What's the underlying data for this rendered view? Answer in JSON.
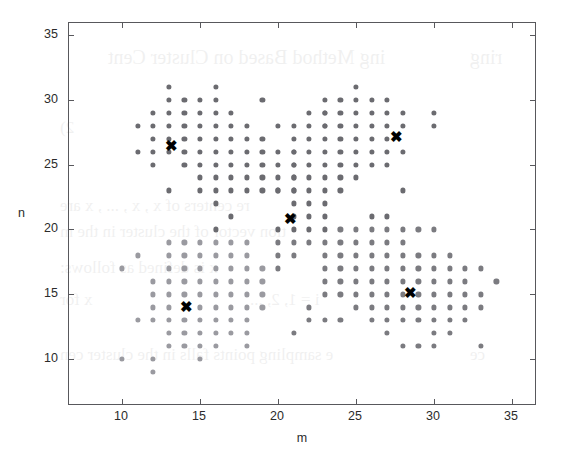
{
  "figure": {
    "axes": {
      "xlabel": "m",
      "ylabel": "n",
      "xticks": [
        10,
        15,
        20,
        25,
        30,
        35
      ],
      "yticks": [
        10,
        15,
        20,
        25,
        30,
        35
      ],
      "xlim": [
        6.6,
        36.6
      ],
      "ylim": [
        6.4,
        35.9
      ],
      "box": true,
      "grid": false,
      "axis_color": "#58585c"
    },
    "bleed_text": [
      {
        "text": "ing Method Based on Cluster Cent",
        "x": 108,
        "y": 46,
        "size": 20
      },
      {
        "text": "ring",
        "x": 470,
        "y": 46,
        "size": 20
      },
      {
        "text": "2)",
        "x": 60,
        "y": 118,
        "size": 17
      },
      {
        "text": "re centers of x  , x  , ... , x     are",
        "x": 60,
        "y": 196,
        "size": 17
      },
      {
        "text": "tion vector of the cluster in the m",
        "x": 60,
        "y": 222,
        "size": 17
      },
      {
        "text": "x    is defined as follows:",
        "x": 60,
        "y": 258,
        "size": 17
      },
      {
        "text": "x   for",
        "x": 60,
        "y": 290,
        "size": 17
      },
      {
        "text": "i = 1, 2, ...",
        "x": 250,
        "y": 290,
        "size": 17
      },
      {
        "text": "e sampling points falls in the cluster cen",
        "x": 60,
        "y": 345,
        "size": 17
      },
      {
        "text": "ce",
        "x": 470,
        "y": 345,
        "size": 17
      }
    ]
  },
  "chart_data": {
    "type": "scatter",
    "title": "",
    "xlabel": "m",
    "ylabel": "n",
    "xlim": [
      6.6,
      36.6
    ],
    "ylim": [
      6.4,
      35.9
    ],
    "grid": false,
    "legend": null,
    "series": [
      {
        "name": "cluster-1-points",
        "marker": "circle",
        "color": "#6b6b70",
        "size": 5.2,
        "points": [
          [
            13,
            31
          ],
          [
            16,
            31
          ],
          [
            13,
            30
          ],
          [
            14,
            30
          ],
          [
            15,
            30
          ],
          [
            16,
            30
          ],
          [
            19,
            30
          ],
          [
            12,
            29
          ],
          [
            13,
            29
          ],
          [
            14,
            29
          ],
          [
            15,
            29
          ],
          [
            16,
            29
          ],
          [
            17,
            29
          ],
          [
            23,
            29
          ],
          [
            11,
            28
          ],
          [
            12,
            28
          ],
          [
            13,
            28
          ],
          [
            14,
            28
          ],
          [
            15,
            28
          ],
          [
            16,
            28
          ],
          [
            17,
            28
          ],
          [
            18,
            28
          ],
          [
            20,
            28
          ],
          [
            23,
            28
          ],
          [
            12,
            27
          ],
          [
            13,
            27
          ],
          [
            14,
            27
          ],
          [
            15,
            27
          ],
          [
            16,
            27
          ],
          [
            17,
            27
          ],
          [
            18,
            27
          ],
          [
            11,
            26
          ],
          [
            12,
            26
          ],
          [
            13,
            26
          ],
          [
            14,
            26
          ],
          [
            15,
            26
          ],
          [
            16,
            26
          ],
          [
            17,
            26
          ],
          [
            18,
            26
          ],
          [
            19,
            26
          ],
          [
            21,
            26
          ],
          [
            12,
            25
          ],
          [
            14,
            25
          ],
          [
            15,
            25
          ],
          [
            16,
            25
          ],
          [
            17,
            25
          ],
          [
            18,
            25
          ],
          [
            19,
            25
          ],
          [
            21,
            25
          ],
          [
            15,
            24
          ],
          [
            16,
            24
          ],
          [
            17,
            24
          ],
          [
            18,
            24
          ],
          [
            19,
            24
          ],
          [
            21,
            24
          ],
          [
            13,
            23
          ],
          [
            15,
            23
          ],
          [
            16,
            23
          ],
          [
            17,
            23
          ],
          [
            18,
            23
          ],
          [
            19,
            23
          ],
          [
            20,
            23
          ],
          [
            21,
            23
          ],
          [
            16,
            22
          ],
          [
            21,
            22
          ],
          [
            22,
            22
          ],
          [
            17,
            21
          ],
          [
            21,
            21
          ],
          [
            22,
            21
          ],
          [
            23,
            21
          ],
          [
            16,
            20
          ],
          [
            20,
            20
          ],
          [
            21,
            20
          ],
          [
            22,
            20
          ],
          [
            23,
            20
          ]
        ]
      },
      {
        "name": "cluster-2-points",
        "marker": "circle",
        "color": "#6b6b70",
        "size": 5.2,
        "points": [
          [
            25,
            31
          ],
          [
            23,
            30
          ],
          [
            24,
            30
          ],
          [
            25,
            30
          ],
          [
            26,
            30
          ],
          [
            27,
            30
          ],
          [
            22,
            29
          ],
          [
            23,
            29
          ],
          [
            24,
            29
          ],
          [
            25,
            29
          ],
          [
            26,
            29
          ],
          [
            27,
            29
          ],
          [
            28,
            29
          ],
          [
            30,
            29
          ],
          [
            21,
            28
          ],
          [
            22,
            28
          ],
          [
            23,
            28
          ],
          [
            24,
            28
          ],
          [
            25,
            28
          ],
          [
            26,
            28
          ],
          [
            27,
            28
          ],
          [
            28,
            28
          ],
          [
            30,
            28
          ],
          [
            19,
            27
          ],
          [
            21,
            27
          ],
          [
            22,
            27
          ],
          [
            23,
            27
          ],
          [
            24,
            27
          ],
          [
            25,
            27
          ],
          [
            26,
            27
          ],
          [
            27,
            27
          ],
          [
            20,
            26
          ],
          [
            21,
            26
          ],
          [
            22,
            26
          ],
          [
            23,
            26
          ],
          [
            24,
            26
          ],
          [
            25,
            26
          ],
          [
            26,
            26
          ],
          [
            27,
            26
          ],
          [
            28,
            26
          ],
          [
            20,
            25
          ],
          [
            21,
            25
          ],
          [
            22,
            25
          ],
          [
            23,
            25
          ],
          [
            24,
            25
          ],
          [
            25,
            25
          ],
          [
            26,
            25
          ],
          [
            27,
            25
          ],
          [
            20,
            24
          ],
          [
            21,
            24
          ],
          [
            22,
            24
          ],
          [
            23,
            24
          ],
          [
            24,
            24
          ],
          [
            25,
            24
          ],
          [
            20,
            23
          ],
          [
            21,
            23
          ],
          [
            22,
            23
          ],
          [
            23,
            23
          ],
          [
            24,
            23
          ],
          [
            28,
            23
          ],
          [
            23,
            22
          ],
          [
            26,
            21
          ],
          [
            27,
            21
          ]
        ]
      },
      {
        "name": "cluster-3-points",
        "marker": "circle",
        "color": "#9a9aa0",
        "size": 5.2,
        "points": [
          [
            13,
            19
          ],
          [
            14,
            19
          ],
          [
            15,
            19
          ],
          [
            16,
            19
          ],
          [
            17,
            19
          ],
          [
            18,
            19
          ],
          [
            11,
            18
          ],
          [
            13,
            18
          ],
          [
            14,
            18
          ],
          [
            15,
            18
          ],
          [
            16,
            18
          ],
          [
            17,
            18
          ],
          [
            18,
            18
          ],
          [
            10,
            17
          ],
          [
            13,
            17
          ],
          [
            14,
            17
          ],
          [
            15,
            17
          ],
          [
            16,
            17
          ],
          [
            17,
            17
          ],
          [
            18,
            17
          ],
          [
            19,
            17
          ],
          [
            12,
            16
          ],
          [
            13,
            16
          ],
          [
            14,
            16
          ],
          [
            15,
            16
          ],
          [
            16,
            16
          ],
          [
            17,
            16
          ],
          [
            18,
            16
          ],
          [
            19,
            16
          ],
          [
            12,
            15
          ],
          [
            13,
            15
          ],
          [
            14,
            15
          ],
          [
            15,
            15
          ],
          [
            16,
            15
          ],
          [
            17,
            15
          ],
          [
            18,
            15
          ],
          [
            19,
            15
          ],
          [
            12,
            14
          ],
          [
            13,
            14
          ],
          [
            15,
            14
          ],
          [
            16,
            14
          ],
          [
            17,
            14
          ],
          [
            18,
            14
          ],
          [
            19,
            14
          ],
          [
            11,
            13
          ],
          [
            12,
            13
          ],
          [
            13,
            13
          ],
          [
            14,
            13
          ],
          [
            15,
            13
          ],
          [
            16,
            13
          ],
          [
            17,
            13
          ],
          [
            18,
            13
          ],
          [
            13,
            12
          ],
          [
            14,
            12
          ],
          [
            15,
            12
          ],
          [
            16,
            12
          ],
          [
            17,
            12
          ],
          [
            18,
            12
          ],
          [
            13,
            11
          ],
          [
            14,
            11
          ],
          [
            15,
            11
          ],
          [
            16,
            11
          ],
          [
            18,
            11
          ],
          [
            10,
            10
          ],
          [
            12,
            10
          ],
          [
            15,
            10
          ],
          [
            12,
            9
          ]
        ]
      },
      {
        "name": "cluster-4-points",
        "marker": "circle",
        "color": "#7b7b80",
        "size": 5.2,
        "points": [
          [
            24,
            20
          ],
          [
            25,
            20
          ],
          [
            26,
            20
          ],
          [
            27,
            20
          ],
          [
            28,
            20
          ],
          [
            29,
            20
          ],
          [
            30,
            20
          ],
          [
            20,
            19
          ],
          [
            21,
            19
          ],
          [
            22,
            19
          ],
          [
            23,
            19
          ],
          [
            24,
            19
          ],
          [
            25,
            19
          ],
          [
            26,
            19
          ],
          [
            27,
            19
          ],
          [
            28,
            19
          ],
          [
            20,
            18
          ],
          [
            21,
            18
          ],
          [
            23,
            18
          ],
          [
            24,
            18
          ],
          [
            25,
            18
          ],
          [
            26,
            18
          ],
          [
            27,
            18
          ],
          [
            28,
            18
          ],
          [
            29,
            18
          ],
          [
            30,
            18
          ],
          [
            31,
            18
          ],
          [
            20,
            17
          ],
          [
            23,
            17
          ],
          [
            24,
            17
          ],
          [
            25,
            17
          ],
          [
            26,
            17
          ],
          [
            27,
            17
          ],
          [
            28,
            17
          ],
          [
            29,
            17
          ],
          [
            30,
            17
          ],
          [
            31,
            17
          ],
          [
            32,
            17
          ],
          [
            33,
            17
          ],
          [
            23,
            16
          ],
          [
            24,
            16
          ],
          [
            25,
            16
          ],
          [
            26,
            16
          ],
          [
            27,
            16
          ],
          [
            28,
            16
          ],
          [
            29,
            16
          ],
          [
            30,
            16
          ],
          [
            31,
            16
          ],
          [
            32,
            16
          ],
          [
            34,
            16
          ],
          [
            23,
            15
          ],
          [
            24,
            15
          ],
          [
            25,
            15
          ],
          [
            26,
            15
          ],
          [
            27,
            15
          ],
          [
            28,
            15
          ],
          [
            29,
            15
          ],
          [
            30,
            15
          ],
          [
            31,
            15
          ],
          [
            32,
            15
          ],
          [
            33,
            15
          ],
          [
            22,
            14
          ],
          [
            25,
            14
          ],
          [
            26,
            14
          ],
          [
            27,
            14
          ],
          [
            28,
            14
          ],
          [
            29,
            14
          ],
          [
            30,
            14
          ],
          [
            31,
            14
          ],
          [
            32,
            14
          ],
          [
            33,
            14
          ],
          [
            22,
            13
          ],
          [
            23,
            13
          ],
          [
            24,
            13
          ],
          [
            26,
            13
          ],
          [
            27,
            13
          ],
          [
            28,
            13
          ],
          [
            29,
            13
          ],
          [
            30,
            13
          ],
          [
            31,
            13
          ],
          [
            32,
            13
          ],
          [
            21,
            12
          ],
          [
            27,
            12
          ],
          [
            30,
            12
          ],
          [
            31,
            12
          ],
          [
            28,
            11
          ],
          [
            29,
            11
          ],
          [
            30,
            11
          ],
          [
            33,
            11
          ]
        ]
      },
      {
        "name": "cluster-centers",
        "marker": "x",
        "color": "#000000",
        "size": 15,
        "points": [
          [
            13.2,
            26.5
          ],
          [
            20.8,
            20.9
          ],
          [
            27.6,
            27.2
          ],
          [
            28.5,
            15.2
          ],
          [
            14.1,
            14.1
          ]
        ]
      }
    ]
  }
}
